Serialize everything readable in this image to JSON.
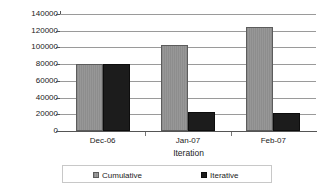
{
  "chart_data": {
    "type": "bar",
    "title": "",
    "xlabel": "Iteration",
    "ylabel": "No. Pages",
    "categories": [
      "Dec-06",
      "Jan-07",
      "Feb-07"
    ],
    "series": [
      {
        "name": "Cumulative",
        "values": [
          80000,
          103000,
          125000
        ],
        "color": "#939393"
      },
      {
        "name": "Iterative",
        "values": [
          80000,
          23000,
          22000
        ],
        "color": "#1c1c1c"
      }
    ],
    "ylim": [
      0,
      140000
    ],
    "ytick_values": [
      0,
      20000,
      40000,
      60000,
      80000,
      100000,
      120000,
      140000
    ],
    "ytick_labels": [
      "0",
      "20000",
      "40000",
      "60000",
      "80000",
      "100000",
      "120000",
      "140000"
    ],
    "grid": true,
    "grid_axis": "y",
    "legend_position": "bottom",
    "legend_entries": [
      "Cumulative",
      "Iterative"
    ]
  },
  "axes": {
    "y_title": "No. Pages",
    "x_title": "Iteration"
  },
  "legend": {
    "cumulative_label": "Cumulative",
    "iterative_label": "Iterative"
  }
}
